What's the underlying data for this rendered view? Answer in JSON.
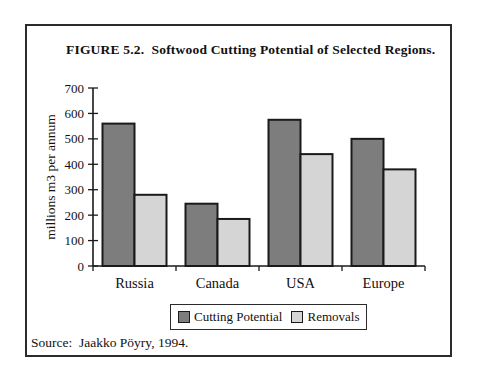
{
  "figure": {
    "title": "FIGURE 5.2.  Softwood Cutting Potential of Selected Regions.",
    "source": "Source:  Jaakko Pöyry, 1994."
  },
  "chart_data": {
    "type": "bar",
    "categories": [
      "Russia",
      "Canada",
      "USA",
      "Europe"
    ],
    "series": [
      {
        "name": "Cutting Potential",
        "values": [
          560,
          245,
          575,
          500
        ],
        "color": "#7d7d7d"
      },
      {
        "name": "Removals",
        "values": [
          280,
          185,
          440,
          380
        ],
        "color": "#d5d5d5"
      }
    ],
    "title": "FIGURE 5.2.  Softwood Cutting Potential of Selected Regions.",
    "xlabel": "",
    "ylabel": "millions m3 per annum",
    "ylim": [
      0,
      700
    ],
    "ytick_step": 100,
    "grid": false,
    "legend_position": "bottom",
    "bar_border_color": "#1a1a1a",
    "axis_color": "#1a1a1a"
  }
}
